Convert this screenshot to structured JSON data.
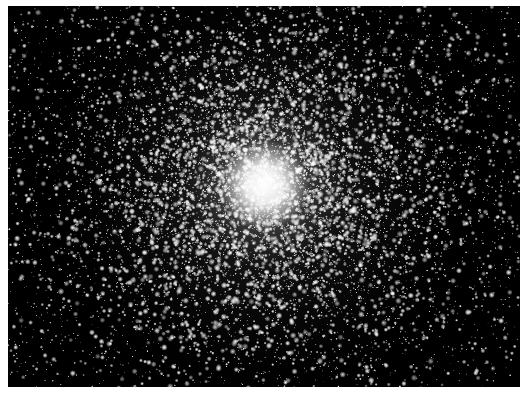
{
  "image": {
    "subject": "globular star cluster",
    "description": "Dense field of white stars on a black background, concentrating into a bright white core near the center",
    "background_color": "#000000",
    "star_color": "#ffffff",
    "page_background": "#ffffff",
    "core_position_fraction": [
      0.5,
      0.47
    ]
  }
}
